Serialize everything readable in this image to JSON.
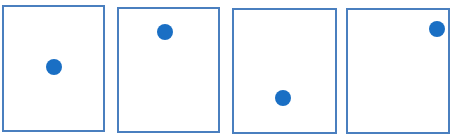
{
  "diagram": {
    "colors": {
      "border": "#4a7fbf",
      "dot": "#1a6fc4",
      "background": "#ffffff"
    },
    "dot_radius": 8,
    "panels": [
      {
        "id": 1,
        "left": 2,
        "top": 5,
        "width": 103,
        "height": 127,
        "dot": {
          "cx": 54,
          "cy": 67
        }
      },
      {
        "id": 2,
        "left": 117,
        "top": 7,
        "width": 103,
        "height": 126,
        "dot": {
          "cx": 165,
          "cy": 32
        }
      },
      {
        "id": 3,
        "left": 232,
        "top": 8,
        "width": 105,
        "height": 126,
        "dot": {
          "cx": 283,
          "cy": 98
        }
      },
      {
        "id": 4,
        "left": 346,
        "top": 8,
        "width": 104,
        "height": 126,
        "dot": {
          "cx": 437,
          "cy": 29
        }
      }
    ]
  }
}
